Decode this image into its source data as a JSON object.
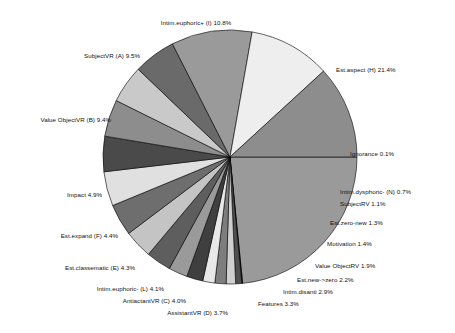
{
  "chart_data": {
    "type": "pie",
    "title": "",
    "subtitle": "",
    "xlabel": "",
    "ylabel": "",
    "legend": "none",
    "grid": false,
    "units": "percent",
    "label_format": "name value%",
    "start_angle_deg": 0,
    "direction": "clockwise",
    "categories": [
      "Est.aspect (H)",
      "Ignorance",
      "Intim.dysphoric- (N)",
      "SubjectRV",
      "Est.zero-new",
      "Motivation",
      "Value ObjectRV",
      "Est.new->zero",
      "Intim.disanti",
      "Features",
      "AssistantVR (D)",
      "AntiactantVR (C)",
      "Intim.euphoric- (L)",
      "Est.classematic (E)",
      "Est.expand (F)",
      "Impact",
      "Value ObjectVR (B)",
      "SubjectVR (A)",
      "Intim.euphoric+ (I)"
    ],
    "values": [
      21.4,
      0.1,
      0.7,
      1.1,
      1.3,
      1.4,
      1.9,
      2.2,
      2.9,
      3.3,
      3.7,
      4.0,
      4.1,
      4.3,
      4.4,
      4.9,
      9.4,
      9.5,
      10.8
    ],
    "colors": [
      "#9a9a9a",
      "#111111",
      "#4f4f4f",
      "#cfcfcf",
      "#7d7d7d",
      "#e8e8e8",
      "#3f3f3f",
      "#9a9a9a",
      "#5e5e5e",
      "#c4c4c4",
      "#6e6e6e",
      "#e0e0e0",
      "#4a4a4a",
      "#8d8d8d",
      "#c9c9c9",
      "#6a6a6a",
      "#9a9a9a",
      "#eeeeee",
      "#8d8d8d",
      "#4a4a4a"
    ],
    "slice_labels": [
      {
        "name": "Intim.euphoric+ (I)",
        "value": 10.8,
        "text": "Intim.euphoric+ (I) 10.8%"
      },
      {
        "name": "Est.aspect (H)",
        "value": 21.4,
        "text": "Est.aspect (H) 21.4%"
      },
      {
        "name": "Ignorance",
        "value": 0.1,
        "text": "Ignorance 0.1%"
      },
      {
        "name": "Intim.dysphoric- (N)",
        "value": 0.7,
        "text": "Intim.dysphoric- (N) 0.7%"
      },
      {
        "name": "SubjectRV",
        "value": 1.1,
        "text": "SubjectRV 1.1%"
      },
      {
        "name": "Est.zero-new",
        "value": 1.3,
        "text": "Est.zero-new 1.3%"
      },
      {
        "name": "Motivation",
        "value": 1.4,
        "text": "Motivation 1.4%"
      },
      {
        "name": "Value ObjectRV",
        "value": 1.9,
        "text": "Value ObjectRV 1.9%"
      },
      {
        "name": "Est.new->zero",
        "value": 2.2,
        "text": "Est.new->zero 2.2%"
      },
      {
        "name": "Intim.disanti",
        "value": 2.9,
        "text": "Intim.disanti 2.9%"
      },
      {
        "name": "Features",
        "value": 3.3,
        "text": "Features 3.3%"
      },
      {
        "name": "AssistantVR (D)",
        "value": 3.7,
        "text": "AssistantVR (D) 3.7%"
      },
      {
        "name": "AntiactantVR (C)",
        "value": 4.0,
        "text": "AntiactantVR (C) 4.0%"
      },
      {
        "name": "Intim.euphoric- (L)",
        "value": 4.1,
        "text": "Intim.euphoric- (L) 4.1%"
      },
      {
        "name": "Est.classematic (E)",
        "value": 4.3,
        "text": "Est.classematic (E) 4.3%"
      },
      {
        "name": "Est.expand (F)",
        "value": 4.4,
        "text": "Est.expand (F) 4.4%"
      },
      {
        "name": "Impact",
        "value": 4.9,
        "text": "Impact 4.9%"
      },
      {
        "name": "Value ObjectVR (B)",
        "value": 9.4,
        "text": "Value ObjectVR (B) 9.4%"
      },
      {
        "name": "SubjectVR (A)",
        "value": 9.5,
        "text": "SubjectVR (A) 9.5%"
      }
    ]
  },
  "labels": {
    "intim_euphoric_plus": "Intim.euphoric+ (I) 10.8%",
    "subjectvr_a": "SubjectVR (A) 9.5%",
    "value_objectvr_b": "Value ObjectVR (B) 9.4%",
    "impact": "Impact 4.9%",
    "est_expand_f": "Est.expand (F) 4.4%",
    "est_classematic_e": "Est.classematic (E) 4.3%",
    "intim_euphoric_minus_l": "Intim.euphoric- (L) 4.1%",
    "antiactantvr_c": "AntiactantVR (C) 4.0%",
    "assistantvr_d": "AssistantVR (D) 3.7%",
    "features": "Features 3.3%",
    "intim_disanti": "Intim.disanti 2.9%",
    "est_new_zero": "Est.new->zero 2.2%",
    "value_objectrv": "Value ObjectRV 1.9%",
    "motivation": "Motivation 1.4%",
    "est_zero_new": "Est.zero-new 1.3%",
    "subjectrv": "SubjectRV 1.1%",
    "intim_dysphoric_n": "Intim.dysphoric- (N) 0.7%",
    "ignorance": "Ignorance 0.1%",
    "est_aspect_h": "Est.aspect (H) 21.4%"
  }
}
